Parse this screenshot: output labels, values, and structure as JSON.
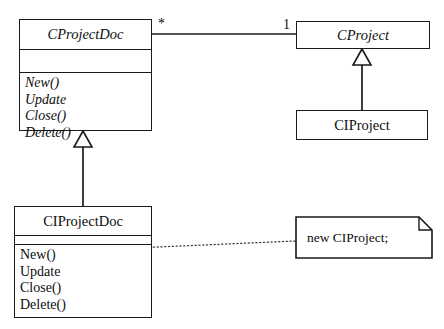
{
  "diagram": {
    "type": "uml-class-diagram",
    "background_color": "#ffffff",
    "line_color": "#1a1a1a",
    "text_color": "#0d0d0d"
  },
  "classes": [
    {
      "id": "cprojectdoc",
      "name": "CProjectDoc",
      "abstract": true,
      "attributes": [],
      "operations": [
        "New()",
        "Update",
        "Close()",
        "Delete()"
      ],
      "operations_abstract": true
    },
    {
      "id": "cproject",
      "name": "CProject",
      "abstract": true,
      "attributes": [],
      "operations": [],
      "operations_abstract": false
    },
    {
      "id": "ciproject",
      "name": "CIProject",
      "abstract": false,
      "attributes": [],
      "operations": [],
      "operations_abstract": false
    },
    {
      "id": "ciprojectdoc",
      "name": "CIProjectDoc",
      "abstract": false,
      "attributes": [],
      "operations": [
        "New()",
        "Update",
        "Close()",
        "Delete()"
      ],
      "operations_abstract": false
    }
  ],
  "associations": [
    {
      "id": "doc-project-association",
      "source": "cprojectdoc",
      "target": "cproject",
      "source_multiplicity": "*",
      "target_multiplicity": "1"
    }
  ],
  "generalizations": [
    {
      "id": "ciprojectdoc-to-cprojectdoc",
      "child": "ciprojectdoc",
      "parent": "cprojectdoc"
    },
    {
      "id": "ciproject-to-cproject",
      "child": "ciproject",
      "parent": "cproject"
    }
  ],
  "note": {
    "id": "new-ciproject-note",
    "text": "new CIProject;",
    "anchored_to": "ciprojectdoc.New()"
  }
}
